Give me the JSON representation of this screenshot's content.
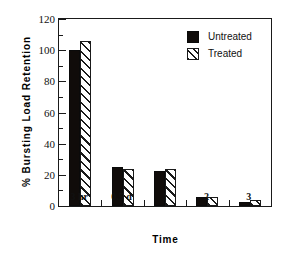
{
  "chart_data": {
    "type": "bar",
    "title": "",
    "subtitle": "",
    "xlabel": "Time",
    "ylabel": "% Bursting Load Retention",
    "categories": [
      "3 hr",
      "0.5 d",
      "1",
      "2",
      "3"
    ],
    "series": [
      {
        "name": "Untreated",
        "fill": "solid-black",
        "color": "#100c0a",
        "values": [
          100,
          25,
          22.5,
          6,
          2.5
        ]
      },
      {
        "name": "Treated",
        "fill": "diagonal-hatch",
        "color": "#ffffff",
        "values": [
          106,
          24,
          23.5,
          5.5,
          4
        ]
      }
    ],
    "ylim": [
      0,
      120
    ],
    "ytick_values": [
      0,
      20,
      40,
      60,
      80,
      100,
      120
    ],
    "ytick_labels": [
      "0",
      "20",
      "40",
      "60",
      "80",
      "100",
      "120"
    ],
    "yminor_values": [
      10,
      30,
      50,
      70,
      90,
      110
    ],
    "grid": false,
    "legend_position": "top-right-inside",
    "frame": "full-box"
  },
  "legend": {
    "items": [
      {
        "label": "Untreated",
        "swatch": "solid-black-square"
      },
      {
        "label": "Treated",
        "swatch": "hatched-square"
      }
    ]
  }
}
